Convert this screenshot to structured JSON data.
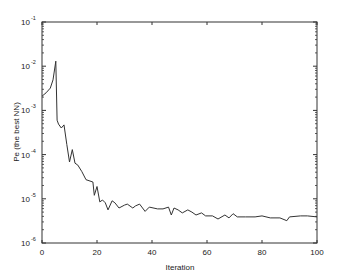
{
  "chart_data": {
    "type": "line",
    "title": "",
    "xlabel": "Iteration",
    "ylabel": "Pe (the best NN)",
    "xlim": [
      0,
      100
    ],
    "ylim": [
      1e-06,
      0.1
    ],
    "yscale": "log",
    "grid": false,
    "legend": null,
    "x_ticks": [
      0,
      20,
      40,
      60,
      80,
      100
    ],
    "x_tick_labels": [
      "0",
      "20",
      "40",
      "60",
      "80",
      "100"
    ],
    "y_ticks": [
      1e-06,
      1e-05,
      0.0001,
      0.001,
      0.01,
      0.1
    ],
    "y_tick_labels": [
      {
        "base": "10",
        "exp": "-6"
      },
      {
        "base": "10",
        "exp": "-5"
      },
      {
        "base": "10",
        "exp": "-4"
      },
      {
        "base": "10",
        "exp": "-3"
      },
      {
        "base": "10",
        "exp": "-2"
      },
      {
        "base": "10",
        "exp": "-1"
      }
    ],
    "series": [
      {
        "name": "Pe",
        "color": "#333333",
        "x": [
          0,
          1.5,
          3,
          4,
          5,
          5.5,
          6,
          7,
          8,
          9,
          10,
          11,
          12,
          13,
          14.5,
          16,
          18.5,
          19,
          20,
          21,
          22,
          23,
          24,
          25.5,
          26.5,
          28,
          30,
          31,
          33,
          34,
          35.5,
          37.5,
          39,
          42,
          44,
          46,
          47,
          48,
          49.5,
          51,
          53,
          54.5,
          56,
          58,
          59.5,
          62,
          64,
          66.5,
          68,
          69.5,
          71,
          74,
          77.5,
          80,
          83,
          86.5,
          89,
          90,
          94,
          96.5,
          100
        ],
        "values": [
          0.0021,
          0.0025,
          0.0032,
          0.0049,
          0.013,
          0.0006,
          0.00049,
          0.0004,
          0.00047,
          0.00017,
          6.8e-05,
          0.00013,
          6.4e-05,
          5.8e-05,
          4.1e-05,
          2.7e-05,
          2.4e-05,
          1.2e-05,
          1.9e-05,
          8.5e-06,
          9.4e-06,
          8.1e-06,
          5.6e-06,
          9e-06,
          8.1e-06,
          6.2e-06,
          7.2e-06,
          7.6e-06,
          6.2e-06,
          6.9e-06,
          7.6e-06,
          5.2e-06,
          6.5e-06,
          5.9e-06,
          5.9e-06,
          6.5e-06,
          4.3e-06,
          6.2e-06,
          5.6e-06,
          4.8e-06,
          5.6e-06,
          5e-06,
          4.3e-06,
          4.8e-06,
          4.1e-06,
          4.1e-06,
          3.5e-06,
          4.3e-06,
          3.7e-06,
          4.6e-06,
          3.9e-06,
          3.9e-06,
          3.9e-06,
          4.1e-06,
          3.7e-06,
          3.7e-06,
          3.2e-06,
          3.9e-06,
          4.1e-06,
          4.1e-06,
          3.9e-06
        ]
      }
    ]
  },
  "layout": {
    "plot_left": 42,
    "plot_right": 317,
    "plot_top": 22,
    "plot_bottom": 243,
    "axis_color": "#333333"
  }
}
